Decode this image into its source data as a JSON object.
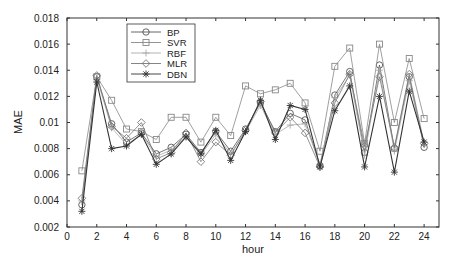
{
  "chart_data": {
    "type": "line",
    "title": "",
    "xlabel": "hour",
    "ylabel": "MAE",
    "xlim": [
      0,
      25
    ],
    "ylim": [
      0.002,
      0.018
    ],
    "xticks": [
      0,
      2,
      4,
      6,
      8,
      10,
      12,
      14,
      16,
      18,
      20,
      22,
      24
    ],
    "yticks": [
      0.002,
      0.004,
      0.006,
      0.008,
      0.01,
      0.012,
      0.014,
      0.016,
      0.018
    ],
    "ytick_labels": [
      "0.002",
      "0.004",
      "0.006",
      "0.008",
      "0.01",
      "0.012",
      "0.014",
      "0.016",
      "0.018"
    ],
    "grid": false,
    "legend_position": "upper left",
    "x": [
      1,
      2,
      3,
      4,
      5,
      6,
      7,
      8,
      9,
      10,
      11,
      12,
      13,
      14,
      15,
      16,
      17,
      18,
      19,
      20,
      21,
      22,
      23,
      24
    ],
    "series": [
      {
        "name": "BP",
        "marker": "circle",
        "color": "#555555",
        "values": [
          0.0037,
          0.0135,
          0.0099,
          0.0085,
          0.0092,
          0.0076,
          0.0081,
          0.0091,
          0.0077,
          0.0093,
          0.0078,
          0.0095,
          0.0115,
          0.0093,
          0.0107,
          0.0102,
          0.0067,
          0.0121,
          0.0139,
          0.0077,
          0.0144,
          0.008,
          0.0135,
          0.0081
        ]
      },
      {
        "name": "SVR",
        "marker": "square",
        "color": "#888888",
        "values": [
          0.0063,
          0.0135,
          0.0117,
          0.0095,
          0.0093,
          0.0087,
          0.0104,
          0.0104,
          0.0085,
          0.0104,
          0.009,
          0.0128,
          0.0122,
          0.0125,
          0.013,
          0.0115,
          0.0078,
          0.0143,
          0.0157,
          0.0084,
          0.016,
          0.01,
          0.0149,
          0.0103
        ]
      },
      {
        "name": "RBF",
        "marker": "plus",
        "color": "#aaaaaa",
        "values": [
          0.004,
          0.0134,
          0.0096,
          0.0083,
          0.0091,
          0.0074,
          0.0079,
          0.0089,
          0.0075,
          0.0091,
          0.0076,
          0.0093,
          0.0113,
          0.0091,
          0.0098,
          0.0099,
          0.0068,
          0.0119,
          0.0136,
          0.0075,
          0.014,
          0.0078,
          0.0132,
          0.0083
        ]
      },
      {
        "name": "MLR",
        "marker": "diamond",
        "color": "#777777",
        "values": [
          0.0042,
          0.0136,
          0.0097,
          0.0088,
          0.01,
          0.0072,
          0.0077,
          0.0092,
          0.007,
          0.0085,
          0.0075,
          0.0094,
          0.0116,
          0.0092,
          0.0104,
          0.0092,
          0.0066,
          0.0115,
          0.0137,
          0.0082,
          0.0135,
          0.0081,
          0.0137,
          0.0084
        ]
      },
      {
        "name": "DBN",
        "marker": "asterisk",
        "color": "#333333",
        "values": [
          0.0032,
          0.0131,
          0.008,
          0.0082,
          0.0091,
          0.0068,
          0.0076,
          0.0089,
          0.0076,
          0.0094,
          0.0071,
          0.0093,
          0.0117,
          0.0087,
          0.0113,
          0.011,
          0.0066,
          0.0109,
          0.0128,
          0.0066,
          0.012,
          0.0062,
          0.0124,
          0.0085
        ]
      }
    ]
  }
}
